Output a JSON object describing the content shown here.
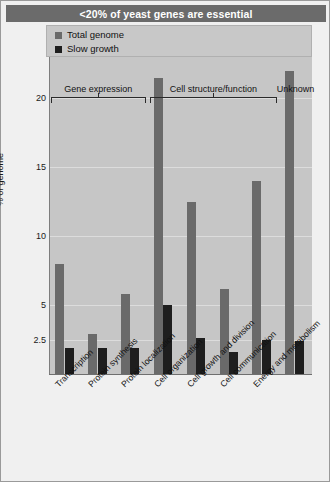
{
  "figure": {
    "title": "<20% of yeast genes are essential"
  },
  "legend": {
    "items": [
      {
        "label": "Total genome",
        "color": "#6a6a6a",
        "key": "total_genome"
      },
      {
        "label": "Slow growth",
        "color": "#1e1e1e",
        "key": "slow_growth"
      }
    ]
  },
  "chart_data": {
    "type": "bar",
    "title": "<20% of yeast genes are essential",
    "xlabel": "",
    "ylabel": "% of genome",
    "ylim": [
      0,
      23
    ],
    "yticks": [
      2.5,
      5,
      10,
      15,
      20
    ],
    "ytick_labels": [
      "2.5",
      "5",
      "10",
      "15",
      "20"
    ],
    "grid": true,
    "legend_position": "top-left",
    "categories": [
      "Transcription",
      "Protein synthesis",
      "Protein localization",
      "Cell organization",
      "Cell growth and division",
      "Cell communication",
      "Energy and metabolism",
      "Unknown"
    ],
    "series": [
      {
        "name": "Total genome",
        "color": "#6a6a6a",
        "values": [
          8.0,
          2.9,
          5.8,
          21.5,
          12.5,
          6.2,
          14.0,
          22.0
        ]
      },
      {
        "name": "Slow growth",
        "color": "#1e1e1e",
        "values": [
          1.9,
          1.9,
          1.9,
          5.0,
          2.6,
          1.6,
          2.5,
          2.4
        ]
      }
    ],
    "groups": [
      {
        "label": "Gene expression",
        "start": 0,
        "end": 2
      },
      {
        "label": "Cell structure/function",
        "start": 3,
        "end": 6
      },
      {
        "label": "Unknown",
        "start": 7,
        "end": 7
      }
    ]
  }
}
